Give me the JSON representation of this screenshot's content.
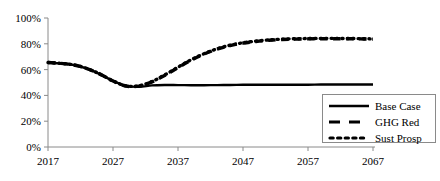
{
  "chart_data": {
    "type": "line",
    "title": "",
    "xlabel": "",
    "ylabel": "",
    "xlim": [
      2017,
      2067
    ],
    "ylim": [
      0,
      1.0
    ],
    "grid": false,
    "legend_position": "bottom-right",
    "x_tick_labels": [
      "2017",
      "2027",
      "2037",
      "2047",
      "2057",
      "2067"
    ],
    "x_ticks": [
      2017,
      2027,
      2037,
      2047,
      2057,
      2067
    ],
    "y_tick_labels": [
      "0%",
      "20%",
      "40%",
      "60%",
      "80%",
      "100%"
    ],
    "y_ticks": [
      0,
      0.2,
      0.4,
      0.6,
      0.8,
      1.0
    ],
    "x": [
      2017,
      2019,
      2021,
      2023,
      2025,
      2027,
      2029,
      2031,
      2033,
      2035,
      2037,
      2039,
      2041,
      2043,
      2045,
      2047,
      2049,
      2051,
      2053,
      2055,
      2057,
      2059,
      2061,
      2063,
      2065,
      2067
    ],
    "series": [
      {
        "name": "Base Case",
        "style": "solid",
        "color": "#000000",
        "values": [
          0.655,
          0.648,
          0.636,
          0.608,
          0.565,
          0.512,
          0.474,
          0.466,
          0.478,
          0.481,
          0.48,
          0.479,
          0.479,
          0.48,
          0.481,
          0.482,
          0.483,
          0.483,
          0.483,
          0.483,
          0.483,
          0.484,
          0.484,
          0.484,
          0.484,
          0.484
        ]
      },
      {
        "name": "GHG Red",
        "style": "dashed",
        "color": "#000000",
        "values": [
          0.655,
          0.648,
          0.636,
          0.608,
          0.565,
          0.512,
          0.473,
          0.472,
          0.505,
          0.556,
          0.615,
          0.672,
          0.72,
          0.758,
          0.786,
          0.805,
          0.818,
          0.827,
          0.833,
          0.836,
          0.838,
          0.839,
          0.839,
          0.839,
          0.838,
          0.836
        ]
      },
      {
        "name": "Sust Prosp",
        "style": "dotted",
        "color": "#000000",
        "values": [
          0.655,
          0.648,
          0.636,
          0.608,
          0.565,
          0.512,
          0.474,
          0.474,
          0.508,
          0.56,
          0.619,
          0.676,
          0.723,
          0.761,
          0.789,
          0.808,
          0.821,
          0.83,
          0.836,
          0.839,
          0.841,
          0.842,
          0.842,
          0.841,
          0.84,
          0.838
        ]
      }
    ]
  },
  "legend": {
    "items": [
      {
        "label": "Base Case",
        "style": "solid"
      },
      {
        "label": "GHG Red",
        "style": "dashed"
      },
      {
        "label": "Sust Prosp",
        "style": "dotted"
      }
    ]
  },
  "colors": {
    "axis": "#8a8a8a",
    "line": "#000000",
    "legend_border": "#8a8a8a",
    "background": "#ffffff"
  }
}
